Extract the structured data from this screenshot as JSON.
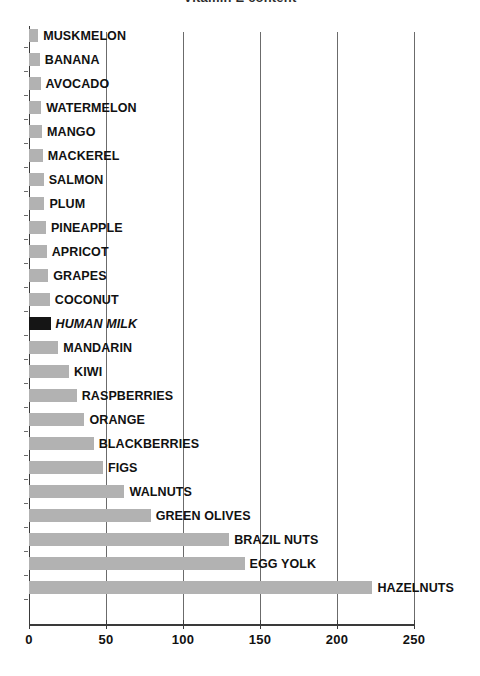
{
  "title_fragment": "Vitamin E content",
  "chart_data": {
    "type": "bar",
    "orientation": "horizontal",
    "title": "",
    "xlabel": "",
    "ylabel": "",
    "xlim": [
      0,
      250
    ],
    "xticks": [
      0,
      50,
      100,
      150,
      200,
      250
    ],
    "xtick_labels": [
      "0",
      "50",
      "100",
      "150",
      "200",
      "250"
    ],
    "grid": true,
    "grid_axis": "x",
    "legend": false,
    "bar_color": "#b2b2b2",
    "highlight_color": "#151515",
    "highlight_category": "HUMAN MILK",
    "categories": [
      "MUSKMELON",
      "BANANA",
      "AVOCADO",
      "WATERMELON",
      "MANGO",
      "MACKEREL",
      "SALMON",
      "PLUM",
      "PINEAPPLE",
      "APRICOT",
      "GRAPES",
      "COCONUT",
      "HUMAN MILK",
      "MANDARIN",
      "KIWI",
      "RASPBERRIES",
      "ORANGE",
      "BLACKBERRIES",
      "FIGS",
      "WALNUTS",
      "GREEN OLIVES",
      "BRAZIL NUTS",
      "EGG YOLK",
      "HAZELNUTS"
    ],
    "values": [
      6,
      7,
      7.5,
      8,
      8.5,
      9,
      9.5,
      10,
      11,
      11.5,
      12.5,
      13.5,
      14,
      19,
      26,
      31,
      36,
      42,
      48,
      62,
      79,
      130,
      140,
      223
    ]
  }
}
